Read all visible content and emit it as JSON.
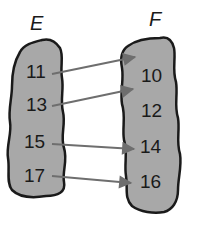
{
  "diagram": {
    "type": "mapping",
    "colors": {
      "set_fill": "#a8a8a8",
      "set_outline": "#1a1a1a",
      "arrow": "#6e6e6e",
      "text": "#1a1a1a",
      "background": "#ffffff"
    },
    "domain": {
      "label": "E",
      "elements": [
        "11",
        "13",
        "15",
        "17"
      ]
    },
    "codomain": {
      "label": "F",
      "elements": [
        "10",
        "12",
        "14",
        "16"
      ]
    },
    "mappings": [
      {
        "from": "11",
        "to": "10"
      },
      {
        "from": "13",
        "to": "12"
      },
      {
        "from": "15",
        "to": "14"
      },
      {
        "from": "17",
        "to": "16"
      }
    ]
  }
}
